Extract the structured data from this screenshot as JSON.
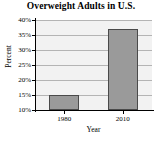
{
  "chart_data": {
    "type": "bar",
    "title": "Overweight Adults in U.S.",
    "categories": [
      "1980",
      "2010"
    ],
    "values": [
      15,
      37
    ],
    "xlabel": "Year",
    "ylabel": "Percent",
    "ylim": [
      10,
      40
    ],
    "ytick_values": [
      10,
      15,
      20,
      25,
      30,
      35,
      40
    ],
    "ytick_labels": [
      "10%",
      "15%",
      "20%",
      "25%",
      "30%",
      "35%",
      "40%"
    ],
    "grid": true,
    "legend": null,
    "series": [
      {
        "name": "Percent of overweight adults",
        "values": [
          15,
          37
        ]
      }
    ],
    "colors": {
      "bar_fill": "#9a9a9a",
      "bar_border": "#4a4a4a",
      "plot_background": "#f2f2f2",
      "gridline": "#b4b4b4",
      "axis": "#000000",
      "text": "#000000"
    }
  }
}
